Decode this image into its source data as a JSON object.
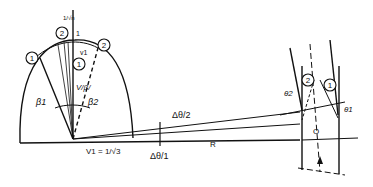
{
  "diagram": {
    "labels": {
      "circle_1_left": "1",
      "circle_2_top": "2",
      "circle_2_right": "2",
      "circle_1_inner": "1",
      "top_axis_mark": "1/√n",
      "top_axis_one": "1",
      "v1_top": "v1",
      "v_beta": "V/β/",
      "beta1": "β1",
      "beta2": "β2",
      "v1_bottom": "V1 = 1/√3",
      "delta_theta_half": "Δθ/2",
      "delta_theta_full": "Δθ/1",
      "radius": "R",
      "circle_2_channel": "2",
      "circle_1_channel": "1",
      "theta2": "θ2",
      "theta1": "θ1",
      "origin": "O"
    },
    "colors": {
      "ink": "#111111",
      "background": "#ffffff"
    }
  }
}
